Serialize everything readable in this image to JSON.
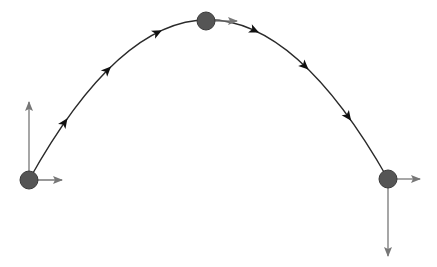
{
  "diagram": {
    "type": "projectile-motion",
    "colors": {
      "background": "#ffffff",
      "trajectory": "#2a2a2a",
      "trajectory_arrow": "#111111",
      "ball_fill": "#555555",
      "ball_stroke": "#3a3a3a",
      "vector": "#777777"
    },
    "trajectory": {
      "start": [
        29,
        180
      ],
      "control": [
        207,
        -140
      ],
      "end": [
        388,
        179
      ],
      "direction_arrows": [
        0.1,
        0.22,
        0.36,
        0.63,
        0.77,
        0.89
      ]
    },
    "balls": [
      {
        "name": "launch-point",
        "center": [
          29,
          180
        ],
        "radius": 9,
        "vectors": [
          {
            "name": "vertical-velocity-up",
            "to": [
              29,
              102
            ]
          },
          {
            "name": "horizontal-velocity",
            "to": [
              62,
              180
            ]
          }
        ]
      },
      {
        "name": "apex-point",
        "center": [
          206,
          21
        ],
        "radius": 9,
        "vectors": [
          {
            "name": "horizontal-velocity",
            "to": [
              237,
              21
            ]
          }
        ]
      },
      {
        "name": "landing-point",
        "center": [
          388,
          179
        ],
        "radius": 9,
        "vectors": [
          {
            "name": "horizontal-velocity",
            "to": [
              420,
              179
            ]
          },
          {
            "name": "vertical-velocity-down",
            "to": [
              388,
              256
            ]
          }
        ]
      }
    ]
  }
}
